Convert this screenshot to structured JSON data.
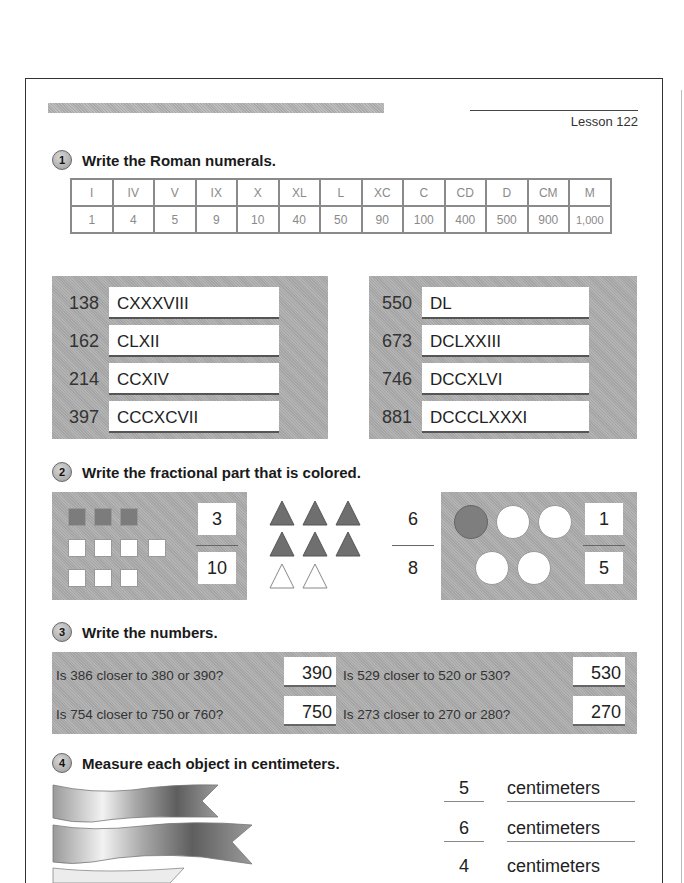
{
  "header": {
    "lesson": "Lesson 122"
  },
  "sections": [
    {
      "number": "1",
      "title": "Write the Roman numerals."
    },
    {
      "number": "2",
      "title": "Write the fractional part that is colored."
    },
    {
      "number": "3",
      "title": "Write the numbers."
    },
    {
      "number": "4",
      "title": "Measure each object in centimeters."
    }
  ],
  "roman_table": {
    "numerals": [
      "I",
      "IV",
      "V",
      "IX",
      "X",
      "XL",
      "L",
      "XC",
      "C",
      "CD",
      "D",
      "CM",
      "M"
    ],
    "values": [
      "1",
      "4",
      "5",
      "9",
      "10",
      "40",
      "50",
      "90",
      "100",
      "400",
      "500",
      "900",
      "1,000"
    ]
  },
  "roman_exercises": {
    "left": [
      {
        "number": "138",
        "answer": "CXXXVIII"
      },
      {
        "number": "162",
        "answer": "CLXII"
      },
      {
        "number": "214",
        "answer": "CCXIV"
      },
      {
        "number": "397",
        "answer": "CCCXCVII"
      }
    ],
    "right": [
      {
        "number": "550",
        "answer": "DL"
      },
      {
        "number": "673",
        "answer": "DCLXXIII"
      },
      {
        "number": "746",
        "answer": "DCCXLVI"
      },
      {
        "number": "881",
        "answer": "DCCCLXXXI"
      }
    ]
  },
  "fractions": [
    {
      "shape": "squares",
      "colored": 3,
      "total": 10,
      "numerator": "3",
      "denominator": "10"
    },
    {
      "shape": "triangles",
      "colored": 6,
      "total": 8,
      "numerator": "6",
      "denominator": "8"
    },
    {
      "shape": "circles",
      "colored": 1,
      "total": 5,
      "numerator": "1",
      "denominator": "5"
    }
  ],
  "rounding": [
    {
      "question": "Is 386 closer to 380 or 390?",
      "answer": "390"
    },
    {
      "question": "Is 529 closer to 520 or 530?",
      "answer": "530"
    },
    {
      "question": "Is 754 closer to 750 or 760?",
      "answer": "750"
    },
    {
      "question": "Is 273 closer to 270 or 280?",
      "answer": "270"
    }
  ],
  "measurements": [
    {
      "value": "5",
      "unit": "centimeters"
    },
    {
      "value": "6",
      "unit": "centimeters"
    },
    {
      "value": "4",
      "unit": "centimeters"
    }
  ]
}
